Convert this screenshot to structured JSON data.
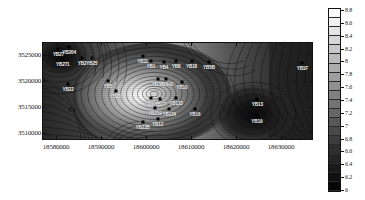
{
  "figure": {
    "type": "contour-map",
    "kind": "filled-contour-with-lines"
  },
  "axes": {
    "x": {
      "label": "",
      "min": 18578000,
      "max": 18634000,
      "ticks": [
        {
          "value": 18580000,
          "label": "18580000"
        },
        {
          "value": 18590000,
          "label": "18590000"
        },
        {
          "value": 18600000,
          "label": "18600000"
        },
        {
          "value": 18610000,
          "label": "18610000"
        },
        {
          "value": 18620000,
          "label": "18620000"
        },
        {
          "value": 18630000,
          "label": "18630000"
        }
      ]
    },
    "y": {
      "label": "",
      "min": 3508800,
      "max": 3527500,
      "ticks": [
        {
          "value": 3525000,
          "label": "3525000"
        },
        {
          "value": 3520000,
          "label": "3520000"
        },
        {
          "value": 3515000,
          "label": "3515000"
        },
        {
          "value": 3510000,
          "label": "3510000"
        }
      ]
    }
  },
  "colorbar": {
    "min": 6,
    "max": 8.8,
    "orientation": "vertical",
    "position": "right",
    "ticks": [
      {
        "value": 8.8,
        "label": "8.8"
      },
      {
        "value": 8.6,
        "label": "8.6"
      },
      {
        "value": 8.4,
        "label": "8.4"
      },
      {
        "value": 8.2,
        "label": "8.2"
      },
      {
        "value": 8.0,
        "label": "8"
      },
      {
        "value": 7.8,
        "label": "7.8"
      },
      {
        "value": 7.6,
        "label": "7.6"
      },
      {
        "value": 7.4,
        "label": "7.4"
      },
      {
        "value": 7.2,
        "label": "7.2"
      },
      {
        "value": 7.0,
        "label": "7"
      },
      {
        "value": 6.8,
        "label": "6.8"
      },
      {
        "value": 6.6,
        "label": "6.6"
      },
      {
        "value": 6.4,
        "label": "6.4"
      },
      {
        "value": 6.2,
        "label": "6.2"
      },
      {
        "value": 6.0,
        "label": "6"
      }
    ],
    "colors": [
      "#ffffff",
      "#f2f2f2",
      "#e4e4e4",
      "#d6d6d6",
      "#c8c8c8",
      "#bababa",
      "#acacac",
      "#9e9e9e",
      "#909090",
      "#828282",
      "#747474",
      "#666666",
      "#585858",
      "#4a4a4a",
      "#3c3c3c",
      "#2e2e2e",
      "#242424",
      "#1a1a1a",
      "#101010",
      "#060606"
    ]
  },
  "chart_data": {
    "type": "heatmap",
    "title": "",
    "xlabel": "",
    "ylabel": "",
    "xlim": [
      18578000,
      18634000
    ],
    "ylim": [
      3508800,
      3527500
    ],
    "zlim": [
      6,
      8.8
    ],
    "zlabel": "",
    "grid": false,
    "legend_position": "right",
    "contour_interval": 0.1,
    "contour_line_labels": [
      "7.8"
    ],
    "wells": [
      {
        "name": "YB27",
        "x": 18581400,
        "y": 3526200,
        "z": 6.4
      },
      {
        "name": "YB204",
        "x": 18583600,
        "y": 3526500,
        "z": 6.3
      },
      {
        "name": "YB271",
        "x": 18582300,
        "y": 3524300,
        "z": 6.5
      },
      {
        "name": "YB2",
        "x": 18586300,
        "y": 3524400,
        "z": 7.2
      },
      {
        "name": "YB25",
        "x": 18588300,
        "y": 3524400,
        "z": 7.3
      },
      {
        "name": "YB22",
        "x": 18583400,
        "y": 3519500,
        "z": 6.9
      },
      {
        "name": "YB5",
        "x": 18591600,
        "y": 3520100,
        "z": 7.6
      },
      {
        "name": "YB20",
        "x": 18593200,
        "y": 3518200,
        "z": 7.5
      },
      {
        "name": "YB11",
        "x": 18598800,
        "y": 3524900,
        "z": 8.3
      },
      {
        "name": "YB1",
        "x": 18600500,
        "y": 3523900,
        "z": 8.4
      },
      {
        "name": "YB4",
        "x": 18603200,
        "y": 3523700,
        "z": 8.0
      },
      {
        "name": "YB8",
        "x": 18605700,
        "y": 3523800,
        "z": 7.8
      },
      {
        "name": "YB18",
        "x": 18608900,
        "y": 3523800,
        "z": 7.5
      },
      {
        "name": "YB3H",
        "x": 18601900,
        "y": 3520400,
        "z": 8.3
      },
      {
        "name": "YB3H2",
        "x": 18603600,
        "y": 3520400,
        "z": 8.1
      },
      {
        "name": "YB10",
        "x": 18606900,
        "y": 3519900,
        "z": 7.6
      },
      {
        "name": "YB5B",
        "x": 18612500,
        "y": 3523600,
        "z": 7.1
      },
      {
        "name": "YB1F",
        "x": 18631800,
        "y": 3523500,
        "z": 6.6
      },
      {
        "name": "YB104",
        "x": 18600600,
        "y": 3516800,
        "z": 8.2
      },
      {
        "name": "YB17",
        "x": 18602400,
        "y": 3516700,
        "z": 8.0
      },
      {
        "name": "YB123",
        "x": 18605700,
        "y": 3516800,
        "z": 7.5
      },
      {
        "name": "YB219",
        "x": 18601300,
        "y": 3514900,
        "z": 7.9
      },
      {
        "name": "YB124",
        "x": 18604300,
        "y": 3514800,
        "z": 7.5
      },
      {
        "name": "YB16",
        "x": 18609600,
        "y": 3514800,
        "z": 7.2
      },
      {
        "name": "YB12",
        "x": 18601900,
        "y": 3512800,
        "z": 7.6
      },
      {
        "name": "YB22B",
        "x": 18598800,
        "y": 3512300,
        "z": 7.4
      },
      {
        "name": "YB13",
        "x": 18622500,
        "y": 3516600,
        "z": 6.3
      },
      {
        "name": "YB19",
        "x": 18622400,
        "y": 3513300,
        "z": 6.2
      }
    ],
    "high_center": {
      "x": 18600200,
      "y": 3519600,
      "z": 8.8
    },
    "low_centers": [
      {
        "x": 18581800,
        "y": 3525500,
        "z": 6.1
      },
      {
        "x": 18622400,
        "y": 3513600,
        "z": 6.0
      }
    ]
  }
}
